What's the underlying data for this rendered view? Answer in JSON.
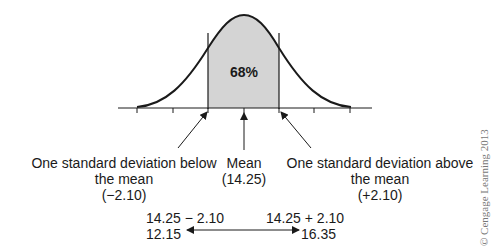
{
  "figure": {
    "type": "normal-distribution-diagram",
    "shaded_area_label": "68%",
    "mean_value": 14.25,
    "standard_deviation": 2.1,
    "colors": {
      "curve": "#1a1a1a",
      "shaded_fill": "#d4d4d4",
      "text": "#1a1a1a",
      "copyright": "#777777"
    }
  },
  "labels": {
    "below": {
      "line1": "One standard deviation below",
      "line2": "the mean",
      "line3": "(−2.10)"
    },
    "mean": {
      "line1": "Mean",
      "line2": "(14.25)"
    },
    "above": {
      "line1": "One standard deviation above",
      "line2": "the mean",
      "line3": "(+2.10)"
    }
  },
  "range": {
    "left_expr": "14.25 − 2.10",
    "left_value": "12.15",
    "right_expr": "14.25 + 2.10",
    "right_value": "16.35"
  },
  "copyright": "© Cengage Learning 2013"
}
